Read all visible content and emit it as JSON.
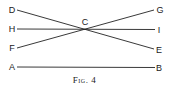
{
  "figure": {
    "caption": "Fig. 4",
    "labels": {
      "D": "D",
      "G": "G",
      "H": "H",
      "I": "I",
      "F": "F",
      "E": "E",
      "A": "A",
      "B": "B",
      "C": "C"
    },
    "lines": [
      {
        "name": "DE",
        "from": "D",
        "to": "E"
      },
      {
        "name": "FG",
        "from": "F",
        "to": "G"
      },
      {
        "name": "HI",
        "from": "H",
        "to": "I"
      },
      {
        "name": "AB",
        "from": "A",
        "to": "B"
      }
    ],
    "intersection": "C",
    "line_color": "#222222"
  }
}
